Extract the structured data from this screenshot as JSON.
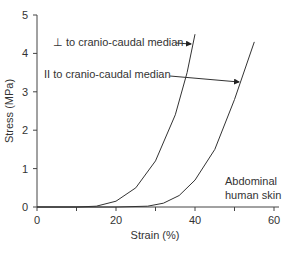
{
  "chart_data": {
    "type": "line",
    "title": "",
    "xlabel": "Strain (%)",
    "ylabel": "Stress (MPa)",
    "xlim": [
      0,
      60
    ],
    "ylim": [
      0,
      5
    ],
    "x_ticks": [
      "0",
      "20",
      "40",
      "60"
    ],
    "y_ticks": [
      "0",
      "1",
      "2",
      "3",
      "4",
      "5"
    ],
    "grid": false,
    "annotation": "Abdominal human skin",
    "annotation_lines": [
      "Abdominal",
      "human skin"
    ],
    "series": [
      {
        "name": "⊥ to cranio-caudal median",
        "x": [
          0,
          10,
          15,
          20,
          25,
          30,
          35,
          38,
          40
        ],
        "y": [
          0,
          0,
          0.02,
          0.15,
          0.5,
          1.2,
          2.4,
          3.5,
          4.5
        ]
      },
      {
        "name": "II to cranio-caudal median",
        "x": [
          0,
          20,
          28,
          32,
          36,
          40,
          45,
          50,
          55
        ],
        "y": [
          0,
          0,
          0.02,
          0.1,
          0.3,
          0.7,
          1.5,
          2.8,
          4.3
        ]
      }
    ]
  }
}
